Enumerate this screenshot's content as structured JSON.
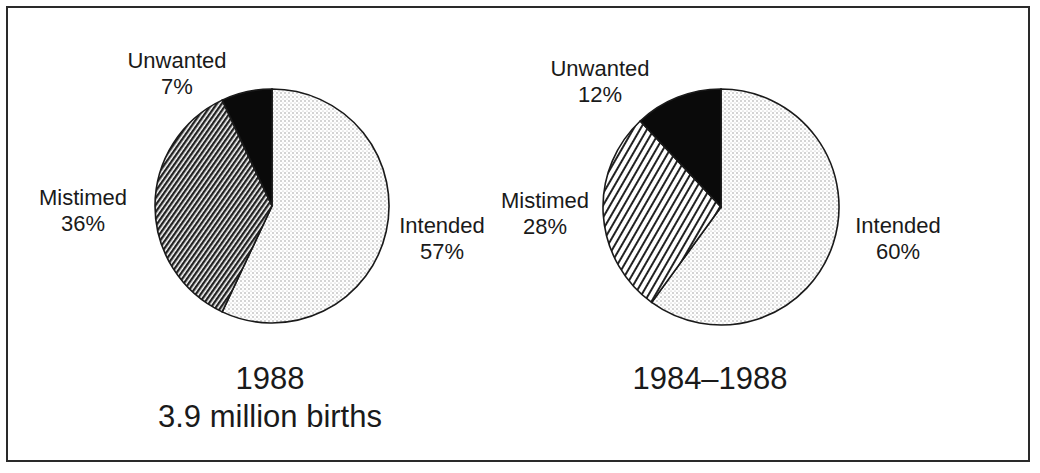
{
  "chart_data": [
    {
      "type": "pie",
      "title": "1988",
      "subtitle": "3.9 million births",
      "categories": [
        "Intended",
        "Mistimed",
        "Unwanted"
      ],
      "values": [
        57,
        36,
        7
      ],
      "labels": [
        "57%",
        "36%",
        "7%"
      ],
      "patterns": [
        "light-dots",
        "dense-diagonal-hatch",
        "solid-black"
      ]
    },
    {
      "type": "pie",
      "title": "1984–1988",
      "subtitle": "",
      "categories": [
        "Intended",
        "Mistimed",
        "Unwanted"
      ],
      "values": [
        60,
        28,
        12
      ],
      "labels": [
        "60%",
        "28%",
        "12%"
      ],
      "patterns": [
        "light-dots",
        "diagonal-hatch",
        "solid-black"
      ]
    }
  ],
  "left": {
    "unwanted": {
      "name": "Unwanted",
      "pct": "7%"
    },
    "mistimed": {
      "name": "Mistimed",
      "pct": "36%"
    },
    "intended": {
      "name": "Intended",
      "pct": "57%"
    },
    "caption_line1": "1988",
    "caption_line2": "3.9 million births"
  },
  "right": {
    "unwanted": {
      "name": "Unwanted",
      "pct": "12%"
    },
    "mistimed": {
      "name": "Mistimed",
      "pct": "28%"
    },
    "intended": {
      "name": "Intended",
      "pct": "60%"
    },
    "caption_line1": "1984–1988"
  },
  "colors": {
    "unwanted": "#0a0a0a",
    "outline": "#1a1a1a",
    "dots": "#8a8a8a",
    "hatch": "#222222"
  }
}
